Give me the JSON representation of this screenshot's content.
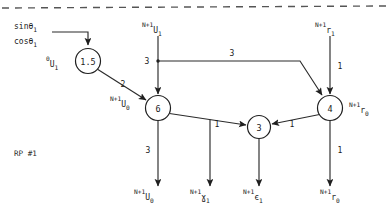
{
  "diagram": {
    "title": "RP #1",
    "caption": "RP #1",
    "type": "signal-flow-graph",
    "separator": {
      "name": "top-dashed-rule",
      "style": "dashed"
    },
    "nodes": [
      {
        "id": "n15",
        "label": "1.5",
        "cx": 88,
        "cy": 61,
        "r": 12.5
      },
      {
        "id": "n6",
        "label": "6",
        "cx": 158,
        "cy": 108,
        "r": 12.5
      },
      {
        "id": "n3",
        "label": "3",
        "cx": 259,
        "cy": 127,
        "r": 11.5
      },
      {
        "id": "n4",
        "label": "4",
        "cx": 330,
        "cy": 108,
        "r": 12.5
      }
    ],
    "edge_weights": [
      {
        "id": "w_15_6",
        "value": "2",
        "x": 123,
        "y": 84
      },
      {
        "id": "w_u1_6",
        "value": "3",
        "x": 147,
        "y": 61
      },
      {
        "id": "w_u1_4",
        "value": "3",
        "x": 232,
        "y": 53
      },
      {
        "id": "w_r1_4",
        "value": "1",
        "x": 340,
        "y": 66
      },
      {
        "id": "w_6_out",
        "value": "3",
        "x": 148,
        "y": 150
      },
      {
        "id": "w_6_3",
        "value": "1",
        "x": 217,
        "y": 124
      },
      {
        "id": "w_4_3",
        "value": "1",
        "x": 292,
        "y": 124
      },
      {
        "id": "w_4_out",
        "value": "1",
        "x": 340,
        "y": 150
      }
    ],
    "signals": [
      {
        "id": "sin_theta1",
        "sup": "",
        "base": "sinθ",
        "sub": "1",
        "x": 14,
        "y": 26,
        "anchor": "start"
      },
      {
        "id": "cos_theta1",
        "sup": "",
        "base": "cosθ",
        "sub": "1",
        "x": 14,
        "y": 41,
        "anchor": "start"
      },
      {
        "id": "u1_init",
        "sup": "0",
        "base": "U",
        "sub": "1",
        "x": 46,
        "y": 64,
        "anchor": "start"
      },
      {
        "id": "u1_in",
        "sup": "N+1",
        "base": "U",
        "sub": "1",
        "x": 142,
        "y": 30,
        "anchor": "start"
      },
      {
        "id": "u0_node",
        "sup": "N+1",
        "base": "U",
        "sub": "0",
        "x": 110,
        "y": 104,
        "anchor": "start"
      },
      {
        "id": "r1_in",
        "sup": "N+1",
        "base": "r",
        "sub": "1",
        "x": 315,
        "y": 30,
        "anchor": "start"
      },
      {
        "id": "r0_node",
        "sup": "N+1",
        "base": "r",
        "sub": "0",
        "x": 349,
        "y": 110,
        "anchor": "start"
      },
      {
        "id": "u0_out",
        "sup": "N+1",
        "base": "U",
        "sub": "0",
        "x": 134,
        "y": 197,
        "anchor": "start"
      },
      {
        "id": "y1_out",
        "sup": "N+1",
        "base": "ɣ",
        "sub": "1",
        "x": 190,
        "y": 197,
        "anchor": "start"
      },
      {
        "id": "e1_out",
        "sup": "N+1",
        "base": "є",
        "sub": "1",
        "x": 243,
        "y": 197,
        "anchor": "start"
      },
      {
        "id": "r0_out",
        "sup": "N+1",
        "base": "r",
        "sub": "0",
        "x": 320,
        "y": 197,
        "anchor": "start"
      }
    ],
    "colors": {
      "stroke": "#1f1f1f",
      "node_fill": "#ffffff",
      "dash": "#555555",
      "text": "#1a1a1a",
      "background": "#ffffff"
    }
  }
}
